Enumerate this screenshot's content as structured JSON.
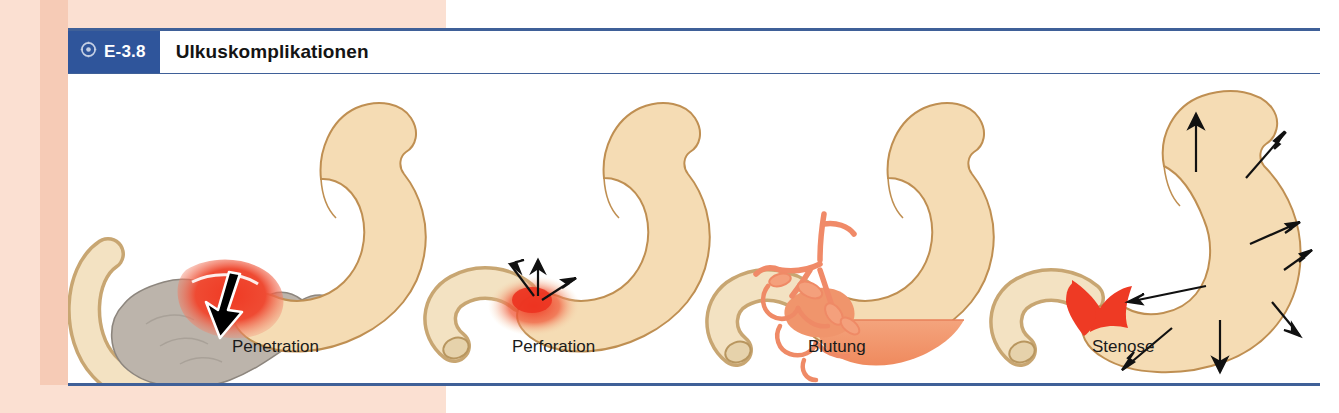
{
  "figure": {
    "number": "E-3.8",
    "title": "Ulkuskomplikationen",
    "badge_icon": "target-dot-icon",
    "accent_blue": "#2f559b",
    "rule_blue": "#3f6098",
    "margin_peach": "#fbe0d2"
  },
  "panels": [
    {
      "id": "penetration",
      "label": "Penetration",
      "organs": [
        "stomach",
        "duodenum",
        "pancreas"
      ],
      "lesion_color": "#ef3a24",
      "organ_color": "#f5dcb4",
      "pancreas_color": "#bab2aa",
      "annotation": "black arrow penetrating from ulcer into pancreas",
      "arrow_count": 1
    },
    {
      "id": "perforation",
      "label": "Perforation",
      "organs": [
        "stomach",
        "duodenum"
      ],
      "lesion_color": "#ef3a24",
      "organ_color": "#f5dcb4",
      "annotation": "three diverging arrows from perforated wall into free abdominal cavity",
      "arrow_count": 3
    },
    {
      "id": "blutung",
      "label": "Blutung",
      "organs": [
        "stomach",
        "duodenum",
        "vessels"
      ],
      "lesion_color": "#f08a60",
      "organ_color": "#f5dcb4",
      "vessel_color": "#f19374",
      "blood_color": "#f3a279",
      "annotation": "eroded arterial vessels with blood pooling to a fluid level in the antrum",
      "arrow_count": 0
    },
    {
      "id": "stenose",
      "label": "Stenose",
      "organs": [
        "stomach",
        "duodenum"
      ],
      "lesion_color": "#ef3a24",
      "organ_color": "#f5dcb4",
      "annotation": "pyloric narrowing with dilated stomach, arrows showing distension",
      "arrow_count": 8
    }
  ]
}
